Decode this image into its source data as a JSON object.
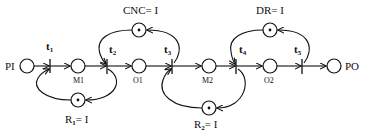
{
  "diagram": {
    "type": "petri-net",
    "places": [
      {
        "id": "PI",
        "label": "PI",
        "tokens": 0
      },
      {
        "id": "M1",
        "label": "M1",
        "tokens": 0
      },
      {
        "id": "O1",
        "label": "O1",
        "tokens": 0
      },
      {
        "id": "M2",
        "label": "M2",
        "tokens": 0
      },
      {
        "id": "O2",
        "label": "O2",
        "tokens": 0
      },
      {
        "id": "PO",
        "label": "PO",
        "tokens": 0
      },
      {
        "id": "CNC",
        "label": "CNC= I",
        "tokens": 1
      },
      {
        "id": "R1",
        "label_main": "R",
        "label_sub": "1",
        "label_rest": "= I",
        "tokens": 1
      },
      {
        "id": "R2",
        "label_main": "R",
        "label_sub": "2",
        "label_rest": "= I",
        "tokens": 1
      },
      {
        "id": "DR",
        "label": "DR= I",
        "tokens": 1
      }
    ],
    "transitions": [
      {
        "id": "t1",
        "main": "t",
        "sub": "1"
      },
      {
        "id": "t2",
        "main": "t",
        "sub": "2"
      },
      {
        "id": "t3",
        "main": "t",
        "sub": "3"
      },
      {
        "id": "t4",
        "main": "t",
        "sub": "4"
      },
      {
        "id": "t5",
        "main": "t",
        "sub": "5"
      }
    ],
    "arcs": [
      [
        "PI",
        "t1"
      ],
      [
        "t1",
        "M1"
      ],
      [
        "M1",
        "t2"
      ],
      [
        "t2",
        "O1"
      ],
      [
        "O1",
        "t3"
      ],
      [
        "t3",
        "M2"
      ],
      [
        "M2",
        "t4"
      ],
      [
        "t4",
        "O2"
      ],
      [
        "O2",
        "t5"
      ],
      [
        "t5",
        "PO"
      ],
      [
        "R1",
        "t1"
      ],
      [
        "t2",
        "R1"
      ],
      [
        "CNC",
        "t2"
      ],
      [
        "t3",
        "CNC"
      ],
      [
        "R2",
        "t3"
      ],
      [
        "t4",
        "R2"
      ],
      [
        "DR",
        "t4"
      ],
      [
        "t5",
        "DR"
      ]
    ]
  }
}
